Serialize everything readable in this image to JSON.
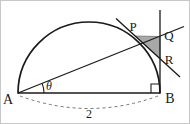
{
  "figure": {
    "background_color": "#ffffff",
    "stroke_color": "#1a1a1a",
    "shaded_fill_color": "#a8a8a8",
    "dashed_color": "#777777",
    "border_color": "#c8c8c8",
    "labels": {
      "vertex_a": "A",
      "vertex_b": "B",
      "point_p": "P",
      "point_q": "Q",
      "point_r": "R",
      "angle_theta": "θ",
      "diameter_length": "2"
    },
    "geometry": {
      "center": {
        "x": 89,
        "y": 93
      },
      "radius": 71,
      "point_a": {
        "x": 18,
        "y": 93
      },
      "point_b": {
        "x": 160,
        "y": 93
      },
      "point_p": {
        "x": 135.6,
        "y": 36.0
      },
      "point_q": {
        "x": 160,
        "y": 36.5
      },
      "point_r": {
        "x": 160,
        "y": 58.5
      },
      "angle_theta_degrees": 21.8,
      "vertical_line_top": {
        "x": 160,
        "y": 10
      },
      "vertical_line_bottom": {
        "x": 160,
        "y": 93
      },
      "ray_extension_end": {
        "x": 184,
        "y": 27
      },
      "tangent_line_start": {
        "x": 116,
        "y": 19
      },
      "tangent_line_end": {
        "x": 180,
        "y": 77
      },
      "angle_arc_radius": 26,
      "right_angle_marker_size": 9,
      "dashed_arc_sag": 13
    }
  }
}
